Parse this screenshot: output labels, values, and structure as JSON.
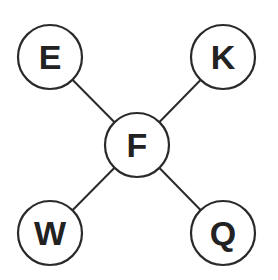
{
  "diagram": {
    "type": "star-graph",
    "center_node": "F",
    "nodes": [
      {
        "id": "E",
        "label": "E",
        "cx": 50,
        "cy": 57,
        "r": 32
      },
      {
        "id": "K",
        "label": "K",
        "cx": 223,
        "cy": 57,
        "r": 32
      },
      {
        "id": "F",
        "label": "F",
        "cx": 137,
        "cy": 145,
        "r": 32
      },
      {
        "id": "W",
        "label": "W",
        "cx": 50,
        "cy": 233,
        "r": 32
      },
      {
        "id": "Q",
        "label": "Q",
        "cx": 223,
        "cy": 233,
        "r": 32
      }
    ],
    "edges": [
      {
        "from": "E",
        "to": "F"
      },
      {
        "from": "K",
        "to": "F"
      },
      {
        "from": "W",
        "to": "F"
      },
      {
        "from": "Q",
        "to": "F"
      }
    ],
    "colors": {
      "stroke": "#2a2a2a",
      "text": "#222222",
      "background": "#ffffff"
    }
  }
}
